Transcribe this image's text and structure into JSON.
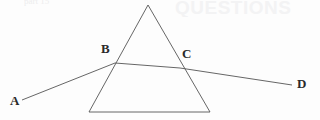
{
  "figure": {
    "name": "prism-refraction-diagram",
    "background_color": "#fdfdfd",
    "stroke_color": "#555555",
    "label_color": "#2a2a2a",
    "width": 320,
    "height": 120
  },
  "bleed": {
    "top_right_ghost": "QUESTIONS",
    "top_left_ghost": "part 15"
  },
  "labels": {
    "a": "A",
    "b": "B",
    "c": "C",
    "d": "D"
  },
  "chart_data": {
    "type": "diagram",
    "title": "",
    "xlabel": "",
    "ylabel": "",
    "grid": false,
    "legend": null,
    "xlim": [
      0,
      320
    ],
    "ylim": [
      0,
      120
    ],
    "points": [
      {
        "name": "A",
        "label": "A",
        "x": 22,
        "y": 100,
        "role": "incident-ray-start"
      },
      {
        "name": "B",
        "label": "B",
        "x": 115,
        "y": 63,
        "role": "entry-point-left-face"
      },
      {
        "name": "C",
        "label": "C",
        "x": 180,
        "y": 68,
        "role": "exit-point-right-face"
      },
      {
        "name": "D",
        "label": "D",
        "x": 292,
        "y": 85,
        "role": "emergent-ray-end"
      },
      {
        "name": "apex",
        "label": "",
        "x": 148,
        "y": 5,
        "role": "prism-apex"
      },
      {
        "name": "base-left",
        "label": "",
        "x": 89,
        "y": 112,
        "role": "prism-base-left"
      },
      {
        "name": "base-right",
        "label": "",
        "x": 210,
        "y": 112,
        "role": "prism-base-right"
      }
    ],
    "shapes": [
      {
        "name": "prism",
        "type": "polygon",
        "points": [
          [
            148,
            5
          ],
          [
            210,
            112
          ],
          [
            89,
            112
          ]
        ],
        "closed": true,
        "fill": "none",
        "stroke": "#555555"
      }
    ],
    "series": [
      {
        "name": "incident-ray",
        "type": "line",
        "x": [
          22,
          115
        ],
        "y": [
          100,
          63
        ],
        "stroke": "#555555"
      },
      {
        "name": "internal-ray",
        "type": "line",
        "x": [
          115,
          180
        ],
        "y": [
          63,
          68
        ],
        "stroke": "#555555"
      },
      {
        "name": "emergent-ray",
        "type": "line",
        "x": [
          180,
          292
        ],
        "y": [
          68,
          85
        ],
        "stroke": "#555555"
      }
    ]
  }
}
